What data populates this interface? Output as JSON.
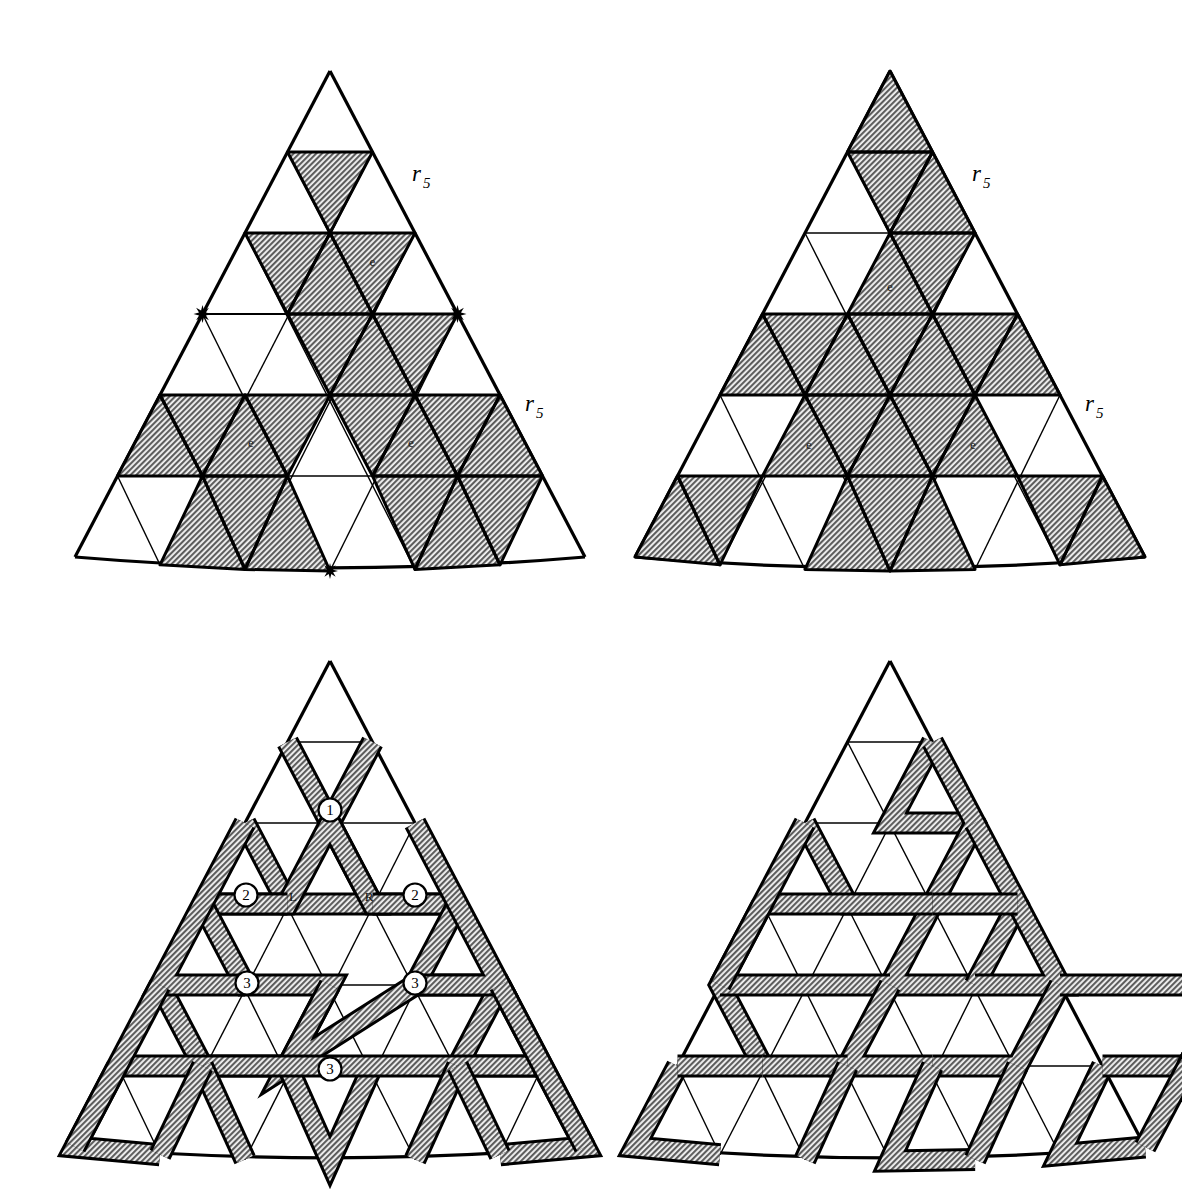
{
  "figure": {
    "background": "#ffffff",
    "ink": "#000000",
    "shade_fill": "#9a9a9a",
    "panel_count": 4
  },
  "geometry": {
    "rows": 6,
    "apex_note": "equilateral triangle subdivided into 6 rows of small triangles",
    "bottom_edge": "slightly convex arc"
  },
  "panels": [
    {
      "id": "top-left",
      "name": "panel-top-left",
      "labels": {
        "r_upper": {
          "base": "r",
          "sub": "5"
        },
        "r_lower": {
          "base": "r",
          "sub": "5"
        },
        "e_marks": [
          "e",
          "e",
          "e"
        ]
      },
      "markers": [
        "star-left",
        "star-right",
        "star-bottom"
      ],
      "shaded_cells": [
        [
          1,
          1
        ],
        [
          1,
          3
        ],
        [
          2,
          1
        ],
        [
          2,
          2
        ],
        [
          2,
          3
        ],
        [
          2,
          5
        ],
        [
          3,
          3
        ],
        [
          3,
          4
        ],
        [
          3,
          5
        ],
        [
          4,
          0
        ],
        [
          4,
          1
        ],
        [
          4,
          2
        ],
        [
          4,
          3
        ],
        [
          4,
          5
        ],
        [
          4,
          6
        ],
        [
          4,
          7
        ],
        [
          4,
          8
        ],
        [
          5,
          2
        ],
        [
          5,
          3
        ],
        [
          5,
          4
        ],
        [
          5,
          7
        ],
        [
          5,
          8
        ],
        [
          5,
          9
        ]
      ]
    },
    {
      "id": "top-right",
      "name": "panel-top-right",
      "labels": {
        "r_upper": {
          "base": "r",
          "sub": "5"
        },
        "r_lower": {
          "base": "r",
          "sub": "5"
        },
        "e_marks": [
          "e",
          "e",
          "e"
        ]
      },
      "markers": [],
      "shaded_cells": [
        [
          0,
          0
        ],
        [
          1,
          1
        ],
        [
          1,
          2
        ],
        [
          2,
          2
        ],
        [
          2,
          3
        ],
        [
          3,
          0
        ],
        [
          3,
          1
        ],
        [
          3,
          2
        ],
        [
          3,
          3
        ],
        [
          3,
          4
        ],
        [
          3,
          5
        ],
        [
          3,
          6
        ],
        [
          4,
          2
        ],
        [
          4,
          3
        ],
        [
          4,
          4
        ],
        [
          4,
          5
        ],
        [
          4,
          6
        ],
        [
          5,
          0
        ],
        [
          5,
          1
        ],
        [
          5,
          4
        ],
        [
          5,
          5
        ],
        [
          5,
          6
        ],
        [
          5,
          9
        ],
        [
          5,
          10
        ]
      ]
    },
    {
      "id": "bottom-left",
      "name": "panel-bottom-left",
      "labels": {
        "circled": [
          "1",
          "2",
          "2",
          "3",
          "3",
          "3"
        ],
        "letters": [
          "L",
          "R"
        ]
      },
      "markers": []
    },
    {
      "id": "bottom-right",
      "name": "panel-bottom-right",
      "labels": {},
      "markers": []
    }
  ],
  "chart_data": {
    "type": "diagram",
    "series": [
      {
        "name": "top-left",
        "shaded_count": 23
      },
      {
        "name": "top-right",
        "shaded_count": 23
      },
      {
        "name": "bottom-left",
        "shaded_count": 0
      },
      {
        "name": "bottom-right",
        "shaded_count": 0
      }
    ]
  }
}
